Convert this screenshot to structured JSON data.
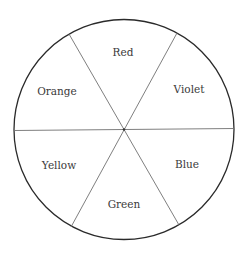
{
  "diagram": {
    "type": "color-wheel",
    "center": {
      "x": 124,
      "y": 129.5
    },
    "radius": 110,
    "outline_color": "#2a2a2a",
    "divider_color": "#6e6e6e",
    "segments": [
      {
        "label": "Red",
        "x": 123,
        "y": 56
      },
      {
        "label": "Violet",
        "x": 190,
        "y": 93
      },
      {
        "label": "Blue",
        "x": 187,
        "y": 167
      },
      {
        "label": "Green",
        "x": 123,
        "y": 208
      },
      {
        "label": "Yellow",
        "x": 59,
        "y": 169
      },
      {
        "label": "Orange",
        "x": 57,
        "y": 94
      }
    ]
  }
}
